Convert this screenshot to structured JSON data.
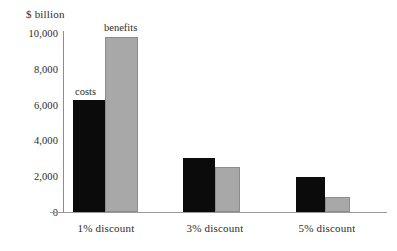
{
  "chart_data": {
    "type": "bar",
    "title": "$ billion",
    "xlabel": "",
    "ylabel": "$ billion",
    "ylim": [
      0,
      10000
    ],
    "yticks": [
      0,
      2000,
      4000,
      6000,
      8000,
      10000
    ],
    "ytick_labels": [
      "0",
      "2,000",
      "4,000",
      "6,000",
      "8,000",
      "10,000"
    ],
    "grid": false,
    "legend_position": "inline-annotation",
    "categories": [
      "1% discount",
      "3% discount",
      "5% discount"
    ],
    "series": [
      {
        "name": "costs",
        "color": "#0b0b0b",
        "values": [
          6250,
          3000,
          1950
        ]
      },
      {
        "name": "benefits",
        "color": "#a8a8a8",
        "values": [
          9780,
          2500,
          850
        ]
      }
    ],
    "annotations": [
      {
        "text": "costs",
        "series": "costs",
        "category": "1% discount"
      },
      {
        "text": "benefits",
        "series": "benefits",
        "category": "1% discount"
      }
    ]
  },
  "colors": {
    "costs": "#0b0b0b",
    "benefits": "#a8a8a8",
    "axis": "#9a9a9a",
    "text": "#2b2b2b",
    "background": "#ffffff"
  }
}
